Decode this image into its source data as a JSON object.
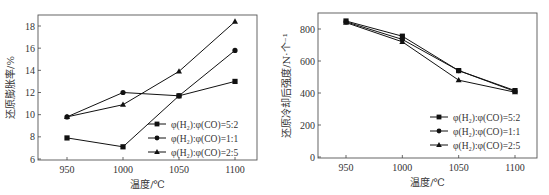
{
  "chart_data": [
    {
      "type": "line",
      "title": "",
      "xlabel": "温度/℃",
      "ylabel": "还原膨胀率/%",
      "x": [
        950,
        1000,
        1050,
        1100
      ],
      "xticks": [
        "950",
        "1000",
        "1050",
        "1100"
      ],
      "yticks": [
        "6",
        "8",
        "10",
        "12",
        "14",
        "16",
        "18"
      ],
      "ylim": [
        6,
        19
      ],
      "xlim": [
        925,
        1125
      ],
      "grid": false,
      "legend_position": "lower right",
      "series": [
        {
          "name": "φ(H₂):φ(CO)=5:2",
          "marker": "square",
          "values": [
            7.9,
            7.1,
            11.7,
            13.0
          ]
        },
        {
          "name": "φ(H₂):φ(CO)=1:1",
          "marker": "circle",
          "values": [
            9.8,
            12.0,
            11.7,
            15.8
          ]
        },
        {
          "name": "φ(H₂):φ(CO)=2:5",
          "marker": "triangle",
          "values": [
            9.8,
            10.9,
            13.9,
            18.4
          ]
        }
      ]
    },
    {
      "type": "line",
      "title": "",
      "xlabel": "温度/℃",
      "ylabel": "还原冷却后强度/N·个⁻¹",
      "x": [
        950,
        1000,
        1050,
        1100
      ],
      "xticks": [
        "950",
        "1000",
        "1050",
        "1100"
      ],
      "yticks": [
        "0",
        "200",
        "400",
        "600",
        "800"
      ],
      "ylim": [
        0,
        900
      ],
      "xlim": [
        925,
        1125
      ],
      "grid": false,
      "legend_position": "lower right",
      "series": [
        {
          "name": "φ(H₂):φ(CO)=5:2",
          "marker": "square",
          "values": [
            850,
            755,
            540,
            415
          ]
        },
        {
          "name": "φ(H₂):φ(CO)=1:1",
          "marker": "circle",
          "values": [
            845,
            735,
            540,
            410
          ]
        },
        {
          "name": "φ(H₂):φ(CO)=2:5",
          "marker": "triangle",
          "values": [
            840,
            720,
            480,
            405
          ]
        }
      ]
    }
  ]
}
